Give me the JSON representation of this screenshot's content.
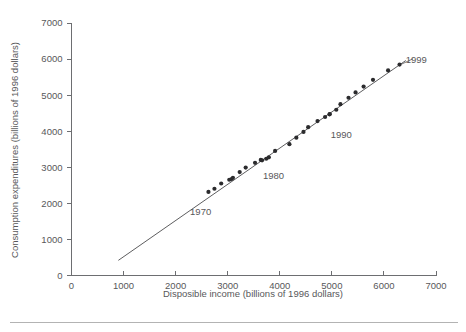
{
  "chart_data": {
    "type": "scatter",
    "title": "",
    "xlabel": "Disposible income (billions of 1996 dollars)",
    "ylabel": "Consumption expenditures (billions of 1996 dollars)",
    "xlim": [
      0,
      7000
    ],
    "ylim": [
      0,
      7000
    ],
    "xticks": [
      0,
      1000,
      2000,
      3000,
      4000,
      5000,
      6000,
      7000
    ],
    "yticks": [
      0,
      1000,
      2000,
      3000,
      4000,
      5000,
      6000,
      7000
    ],
    "xtick_labels": [
      "0",
      "1000",
      "2000",
      "3000",
      "4000",
      "5000",
      "6000",
      "7000"
    ],
    "ytick_labels": [
      "0",
      "1000",
      "2000",
      "3000",
      "4000",
      "5000",
      "6000",
      "7000"
    ],
    "grid": false,
    "legend": null,
    "series": [
      {
        "name": "Annual observations 1970-1999",
        "marker": "filled-circle",
        "color": "#2b2b2d",
        "points": [
          {
            "year": 1970,
            "x": 2630,
            "y": 2317
          },
          {
            "year": 1971,
            "x": 2745,
            "y": 2405
          },
          {
            "year": 1972,
            "x": 2875,
            "y": 2550
          },
          {
            "year": 1973,
            "x": 3075,
            "y": 2675
          },
          {
            "year": 1974,
            "x": 3030,
            "y": 2654
          },
          {
            "year": 1975,
            "x": 3100,
            "y": 2710
          },
          {
            "year": 1976,
            "x": 3230,
            "y": 2868
          },
          {
            "year": 1977,
            "x": 3345,
            "y": 2992
          },
          {
            "year": 1978,
            "x": 3525,
            "y": 3125
          },
          {
            "year": 1979,
            "x": 3635,
            "y": 3204
          },
          {
            "year": 1980,
            "x": 3660,
            "y": 3193
          },
          {
            "year": 1981,
            "x": 3740,
            "y": 3236
          },
          {
            "year": 1982,
            "x": 3790,
            "y": 3276
          },
          {
            "year": 1983,
            "x": 3910,
            "y": 3454
          },
          {
            "year": 1984,
            "x": 4185,
            "y": 3641
          },
          {
            "year": 1985,
            "x": 4318,
            "y": 3820
          },
          {
            "year": 1986,
            "x": 4455,
            "y": 3981
          },
          {
            "year": 1987,
            "x": 4545,
            "y": 4113
          },
          {
            "year": 1988,
            "x": 4725,
            "y": 4280
          },
          {
            "year": 1989,
            "x": 4870,
            "y": 4394
          },
          {
            "year": 1990,
            "x": 4960,
            "y": 4475
          },
          {
            "year": 1991,
            "x": 4955,
            "y": 4467
          },
          {
            "year": 1992,
            "x": 5085,
            "y": 4595
          },
          {
            "year": 1993,
            "x": 5165,
            "y": 4749
          },
          {
            "year": 1994,
            "x": 5320,
            "y": 4928
          },
          {
            "year": 1995,
            "x": 5455,
            "y": 5076
          },
          {
            "year": 1996,
            "x": 5610,
            "y": 5238
          },
          {
            "year": 1997,
            "x": 5790,
            "y": 5424
          },
          {
            "year": 1998,
            "x": 6080,
            "y": 5684
          },
          {
            "year": 1999,
            "x": 6300,
            "y": 5848
          }
        ]
      }
    ],
    "fit_line": {
      "name": "regression-line",
      "x_start": 900,
      "y_start": 420,
      "x_end": 6420,
      "y_end": 5960
    },
    "annotations": [
      {
        "label": "1970",
        "x": 2480,
        "y": 1760,
        "leader": false
      },
      {
        "label": "1980",
        "x": 3880,
        "y": 2760,
        "leader": false
      },
      {
        "label": "1990",
        "x": 5180,
        "y": 3900,
        "leader": false
      },
      {
        "label": "1999",
        "x": 6620,
        "y": 5980,
        "leader": true,
        "leader_from_x": 6340,
        "leader_from_y": 5860,
        "leader_to_x": 6560,
        "leader_to_y": 6010
      }
    ]
  },
  "figure": {
    "bottom_rule_visible": true
  }
}
